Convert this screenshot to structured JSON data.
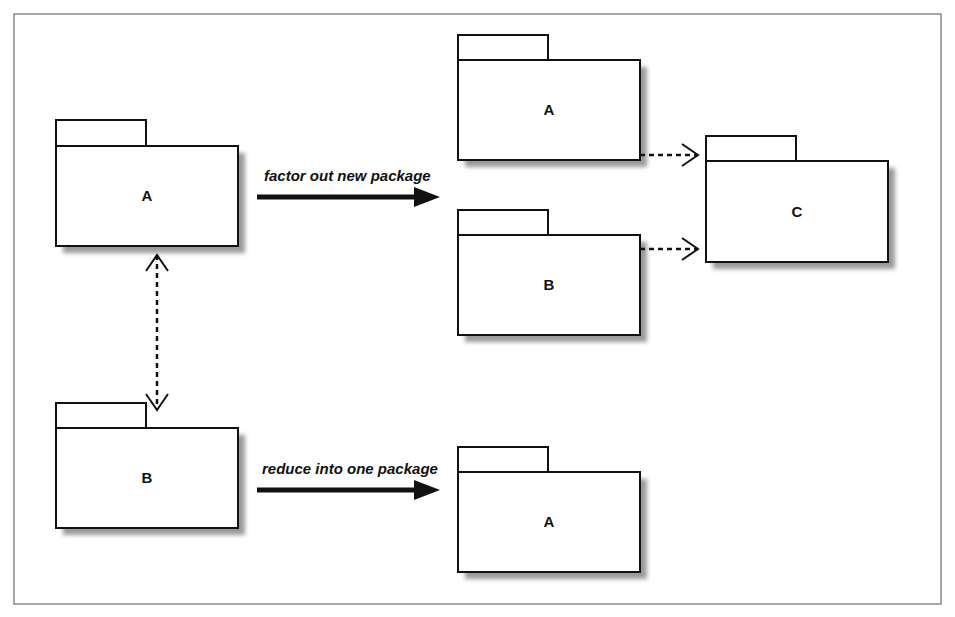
{
  "diagram": {
    "type": "uml-package-diagram",
    "frame": {
      "x": 14,
      "y": 14,
      "width": 927,
      "height": 590,
      "color": "#8a8a8a"
    },
    "packages": [
      {
        "id": "left-a",
        "label": "A",
        "tab": {
          "x": 56,
          "y": 120,
          "w": 90,
          "h": 26
        },
        "body": {
          "x": 56,
          "y": 146,
          "w": 182,
          "h": 100
        }
      },
      {
        "id": "left-b",
        "label": "B",
        "tab": {
          "x": 56,
          "y": 403,
          "w": 90,
          "h": 25
        },
        "body": {
          "x": 56,
          "y": 428,
          "w": 182,
          "h": 100
        }
      },
      {
        "id": "factored-a",
        "label": "A",
        "tab": {
          "x": 458,
          "y": 35,
          "w": 90,
          "h": 25
        },
        "body": {
          "x": 458,
          "y": 60,
          "w": 182,
          "h": 100
        }
      },
      {
        "id": "factored-b",
        "label": "B",
        "tab": {
          "x": 458,
          "y": 210,
          "w": 90,
          "h": 25
        },
        "body": {
          "x": 458,
          "y": 235,
          "w": 182,
          "h": 100
        }
      },
      {
        "id": "factored-c",
        "label": "C",
        "tab": {
          "x": 706,
          "y": 136,
          "w": 90,
          "h": 25
        },
        "body": {
          "x": 706,
          "y": 161,
          "w": 182,
          "h": 101
        }
      },
      {
        "id": "reduced-a",
        "label": "A",
        "tab": {
          "x": 458,
          "y": 447,
          "w": 90,
          "h": 25
        },
        "body": {
          "x": 458,
          "y": 472,
          "w": 182,
          "h": 100
        }
      }
    ],
    "transforms": [
      {
        "id": "factor-out",
        "label": "factor out new package",
        "x1": 257,
        "x2": 440,
        "y": 197,
        "label_x": 264,
        "label_y": 181
      },
      {
        "id": "reduce",
        "label": "reduce into one package",
        "x1": 257,
        "x2": 440,
        "y": 490,
        "label_x": 262,
        "label_y": 474
      }
    ],
    "dependencies": [
      {
        "id": "a-b-cycle",
        "style": "dashed",
        "bidirectional": true,
        "x1": 157,
        "y1": 255,
        "x2": 157,
        "y2": 410
      },
      {
        "id": "a-to-c",
        "style": "dashed",
        "bidirectional": false,
        "x1": 640,
        "y1": 155,
        "x2": 698,
        "y2": 155
      },
      {
        "id": "b-to-c",
        "style": "dashed",
        "bidirectional": false,
        "x1": 640,
        "y1": 249,
        "x2": 698,
        "y2": 249
      }
    ],
    "colors": {
      "stroke": "#111111",
      "shadow": "#9a9a9a",
      "fill": "#ffffff"
    }
  }
}
